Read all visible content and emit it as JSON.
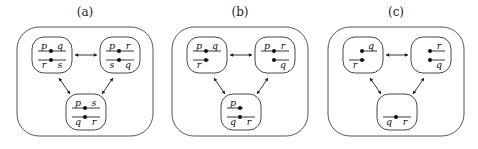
{
  "panels": [
    {
      "title": "(a)",
      "nodes": [
        {
          "id": "top-left",
          "rows": [
            {
              "left": "p",
              "right": "q",
              "dot": true
            },
            {
              "left": "r",
              "right": "s",
              "dot": true
            }
          ]
        },
        {
          "id": "top-right",
          "rows": [
            {
              "left": "p",
              "right": "r",
              "dot": true
            },
            {
              "left": "s",
              "right": "q",
              "dot": true
            }
          ]
        },
        {
          "id": "bottom",
          "rows": [
            {
              "left": "p",
              "right": "s",
              "dot": true
            },
            {
              "left": "q",
              "right": "r",
              "dot": true
            }
          ]
        }
      ]
    },
    {
      "title": "(b)",
      "nodes": [
        {
          "id": "top-left",
          "rows": [
            {
              "left": "p",
              "right": "q",
              "dot": true
            },
            {
              "left": "r",
              "right": "",
              "dot": true
            }
          ]
        },
        {
          "id": "top-right",
          "rows": [
            {
              "left": "p",
              "right": "r",
              "dot": true
            },
            {
              "left": "",
              "right": "q",
              "dot": true
            }
          ]
        },
        {
          "id": "bottom",
          "rows": [
            {
              "left": "p",
              "right": "",
              "dot": true
            },
            {
              "left": "q",
              "right": "r",
              "dot": true
            }
          ]
        }
      ]
    },
    {
      "title": "(c)",
      "nodes": [
        {
          "id": "top-left",
          "rows": [
            {
              "left": "",
              "right": "q",
              "dot": true
            },
            {
              "left": "r",
              "right": "",
              "dot": true
            }
          ]
        },
        {
          "id": "top-right",
          "rows": [
            {
              "left": "",
              "right": "r",
              "dot": true
            },
            {
              "left": "",
              "right": "q",
              "dot": true
            }
          ]
        },
        {
          "id": "bottom",
          "rows": [
            {
              "left": "q",
              "right": "r",
              "dot": true
            }
          ]
        }
      ]
    }
  ],
  "edges": [
    {
      "from": "top-left",
      "to": "top-right",
      "type": "bidirectional"
    },
    {
      "from": "top-left",
      "to": "bottom",
      "type": "bidirectional"
    },
    {
      "from": "top-right",
      "to": "bottom",
      "type": "bidirectional"
    }
  ]
}
